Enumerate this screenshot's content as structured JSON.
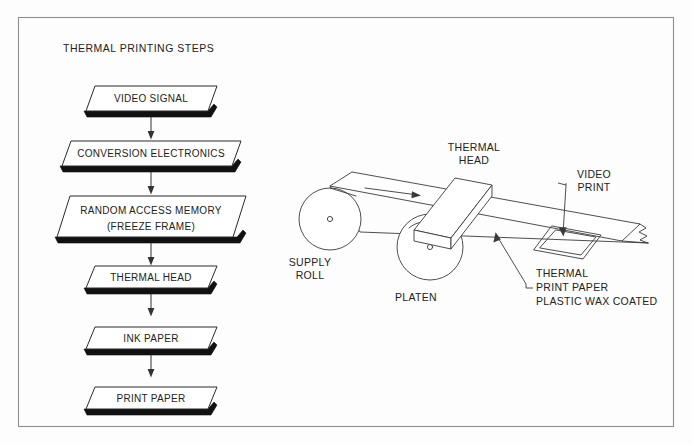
{
  "figure": {
    "title": "THERMAL PRINTING STEPS",
    "frame": {
      "stroke_color": "#8d8d92"
    },
    "background_color": "#fdfdfd",
    "ink_color": "#222222"
  },
  "flowchart": {
    "orientation": "top-to-bottom",
    "node_shape": "parallelogram-3d-slab",
    "steps": [
      {
        "id": "video-signal",
        "lines": [
          "VIDEO SIGNAL"
        ]
      },
      {
        "id": "conversion-electronics",
        "lines": [
          "CONVERSION ELECTRONICS"
        ]
      },
      {
        "id": "random-access-memory",
        "lines": [
          "RANDOM ACCESS MEMORY",
          "(FREEZE FRAME)"
        ]
      },
      {
        "id": "thermal-head",
        "lines": [
          "THERMAL HEAD"
        ]
      },
      {
        "id": "ink-paper",
        "lines": [
          "INK PAPER"
        ]
      },
      {
        "id": "print-paper",
        "lines": [
          "PRINT PAPER"
        ]
      }
    ],
    "connector_count": 5,
    "connector_style": "vertical-line-with-arrowhead"
  },
  "mechanism": {
    "caption": "Thermal printer paper path, isometric view",
    "labels": {
      "thermal_head": [
        "THERMAL",
        "HEAD"
      ],
      "supply_roll": [
        "SUPPLY",
        "ROLL"
      ],
      "platen": [
        "PLATEN"
      ],
      "video_print": [
        "VIDEO",
        "PRINT"
      ],
      "thermal_print_paper": [
        "THERMAL",
        "PRINT PAPER",
        "PLASTIC WAX COATED"
      ]
    },
    "paper_feed_direction": "left-to-right",
    "platen_rotation": "clockwise"
  }
}
